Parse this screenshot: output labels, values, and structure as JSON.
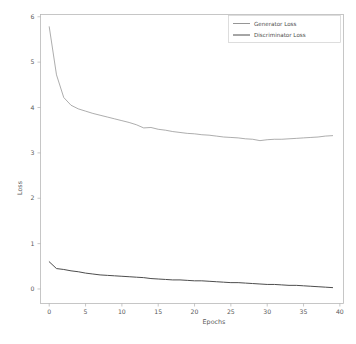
{
  "chart_data": {
    "type": "line",
    "title": "",
    "xlabel": "Epochs",
    "ylabel": "Loss",
    "xlim": [
      -1.2,
      40.5
    ],
    "ylim": [
      -0.32,
      6.05
    ],
    "xticks": [
      0,
      5,
      10,
      15,
      20,
      25,
      30,
      35,
      40
    ],
    "xtick_labels": [
      "0",
      "5",
      "10",
      "15",
      "20",
      "25",
      "30",
      "35",
      "40"
    ],
    "yticks": [
      0,
      1,
      2,
      3,
      4,
      5,
      6
    ],
    "ytick_labels": [
      "0",
      "1",
      "2",
      "3",
      "4",
      "5",
      "6"
    ],
    "grid": false,
    "legend_position": "upper right",
    "x": [
      0,
      1,
      2,
      3,
      4,
      5,
      6,
      7,
      8,
      9,
      10,
      11,
      12,
      13,
      14,
      15,
      16,
      17,
      18,
      19,
      20,
      21,
      22,
      23,
      24,
      25,
      26,
      27,
      28,
      29,
      30,
      31,
      32,
      33,
      34,
      35,
      36,
      37,
      38,
      39
    ],
    "series": [
      {
        "name": "Generator Loss",
        "color": "#8a8a8a",
        "linewidth": 0.7,
        "values": [
          5.78,
          4.72,
          4.22,
          4.05,
          3.97,
          3.92,
          3.87,
          3.83,
          3.79,
          3.75,
          3.71,
          3.67,
          3.62,
          3.55,
          3.56,
          3.52,
          3.5,
          3.47,
          3.45,
          3.43,
          3.42,
          3.4,
          3.39,
          3.37,
          3.35,
          3.34,
          3.33,
          3.31,
          3.3,
          3.27,
          3.29,
          3.3,
          3.3,
          3.31,
          3.32,
          3.33,
          3.34,
          3.35,
          3.37,
          3.38
        ]
      },
      {
        "name": "Discriminator Loss",
        "color": "#4d4d4d",
        "linewidth": 1.0,
        "values": [
          0.6,
          0.45,
          0.43,
          0.4,
          0.38,
          0.35,
          0.33,
          0.31,
          0.3,
          0.29,
          0.28,
          0.27,
          0.26,
          0.25,
          0.23,
          0.22,
          0.21,
          0.2,
          0.2,
          0.19,
          0.18,
          0.18,
          0.17,
          0.16,
          0.15,
          0.14,
          0.14,
          0.13,
          0.12,
          0.11,
          0.1,
          0.1,
          0.09,
          0.08,
          0.08,
          0.07,
          0.06,
          0.05,
          0.04,
          0.03
        ]
      }
    ]
  }
}
